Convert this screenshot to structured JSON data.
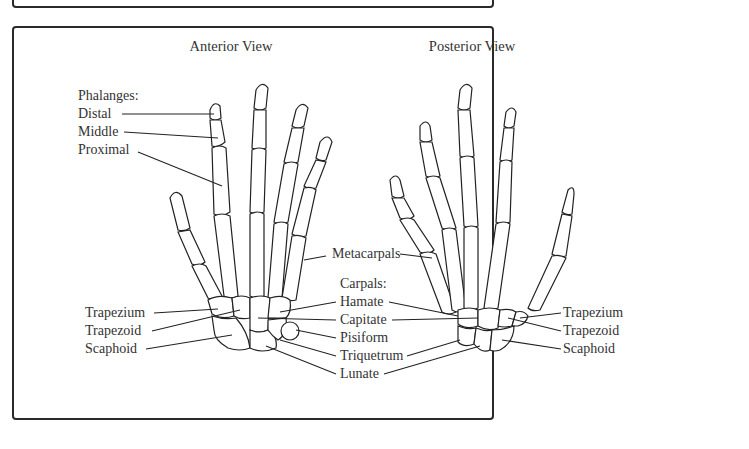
{
  "figure": {
    "views": [
      {
        "title": "Anterior View"
      },
      {
        "title": "Posterior View"
      }
    ],
    "labels": {
      "phalanges_header": "Phalanges:",
      "distal": "Distal",
      "middle": "Middle",
      "proximal": "Proximal",
      "metacarpals": "Metacarpals",
      "carpals_header": "Carpals:",
      "hamate": "Hamate",
      "capitate": "Capitate",
      "pisiform": "Pisiform",
      "triquetrum": "Triquetrum",
      "lunate": "Lunate",
      "left_trapezium": "Trapezium",
      "left_trapezoid": "Trapezoid",
      "left_scaphoid": "Scaphoid",
      "right_trapezium": "Trapezium",
      "right_trapezoid": "Trapezoid",
      "right_scaphoid": "Scaphoid"
    }
  }
}
